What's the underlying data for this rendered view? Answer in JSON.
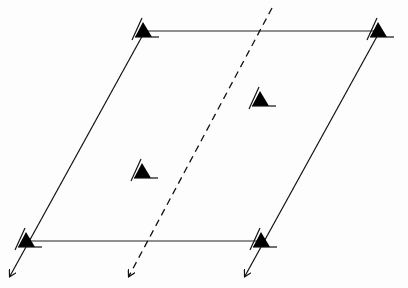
{
  "diagram": {
    "type": "lattice-parallelogram",
    "background": "#fdfdfd",
    "stroke_color": "#111111",
    "corners": {
      "top_left": [
        145,
        31
      ],
      "top_right": [
        380,
        31
      ],
      "bottom_right": [
        263,
        241
      ],
      "bottom_left": [
        28,
        241
      ]
    },
    "markers": [
      {
        "name": "top-left-corner",
        "x": 145,
        "y": 31
      },
      {
        "name": "top-right-corner",
        "x": 380,
        "y": 31
      },
      {
        "name": "bottom-left-corner",
        "x": 28,
        "y": 241
      },
      {
        "name": "bottom-right-corner",
        "x": 263,
        "y": 241
      },
      {
        "name": "inner-upper",
        "x": 262,
        "y": 100
      },
      {
        "name": "inner-lower",
        "x": 144,
        "y": 172
      }
    ],
    "dashed_line": {
      "from": [
        272,
        8
      ],
      "to": [
        131,
        272
      ]
    },
    "arrows": [
      {
        "name": "left-arrow",
        "tip": [
          10,
          276
        ]
      },
      {
        "name": "middle-arrow",
        "tip": [
          129,
          276
        ]
      },
      {
        "name": "right-arrow",
        "tip": [
          245,
          276
        ]
      }
    ]
  }
}
